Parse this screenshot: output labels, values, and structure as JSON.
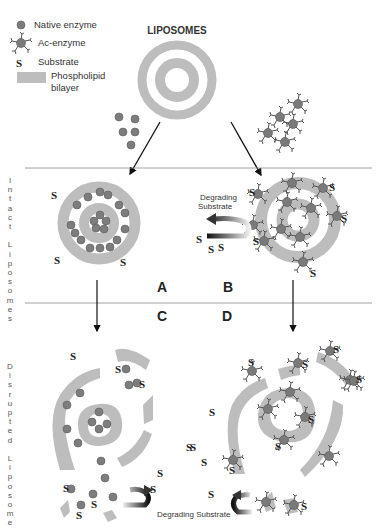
{
  "title": "LIPOSOMES",
  "legend": {
    "native_enzyme": "Native enzyme",
    "ac_enzyme": "Ac-enzyme",
    "substrate_symbol": "S",
    "substrate": "Substrate",
    "bilayer_line1": "Phospholipid",
    "bilayer_line2": "bilayer"
  },
  "row_labels": {
    "intact": "I\nn\nt\na\nc\nt\n \nL\ni\np\no\ns\no\nm\ne\ns",
    "disrupted": "D\ni\ns\nr\nu\np\nt\ne\nd\n \nL\ni\np\no\ns\no\nm\ne"
  },
  "panels": {
    "A": "A",
    "B": "B",
    "C": "C",
    "D": "D"
  },
  "annotations": {
    "degrading_top_line1": "Degrading",
    "degrading_top_line2": "Substrate",
    "degrading_bottom": "Degrading Substrate"
  },
  "substrate_label": "S",
  "colors": {
    "bilayer": "#bdbdbd",
    "enzyme": "#7a7a7a",
    "enzyme_stroke": "#555555",
    "line": "#888888",
    "text": "#222222"
  }
}
